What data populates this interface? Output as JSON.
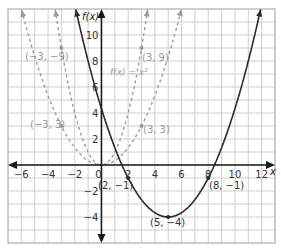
{
  "chart_data": {
    "type": "line",
    "title": "",
    "xlabel": "x",
    "ylabel": "f(x)",
    "xlim": [
      -7,
      13
    ],
    "ylim": [
      -6,
      12
    ],
    "grid": true,
    "x_ticks": [
      -6,
      -4,
      -2,
      0,
      2,
      4,
      6,
      8,
      10,
      12
    ],
    "x_tick_labels": [
      "−6",
      "−4",
      "−2",
      "0",
      "2",
      "4",
      "6",
      "8",
      "10",
      "12"
    ],
    "y_ticks": [
      -4,
      -2,
      2,
      4,
      6,
      8,
      10
    ],
    "y_tick_labels": [
      "−4",
      "−2",
      "2",
      "4",
      "6",
      "8",
      "10"
    ],
    "series": [
      {
        "name": "f(x) = x²",
        "equation": "x^2",
        "style": "dashed",
        "color": "#9a9a9a",
        "points": [
          [
            -3,
            9
          ],
          [
            3,
            9
          ]
        ]
      },
      {
        "name": "(1/3)x²",
        "equation": "x^2/3",
        "style": "dashed",
        "color": "#9a9a9a",
        "points": [
          [
            -3,
            3
          ],
          [
            3,
            3
          ]
        ]
      },
      {
        "name": "(1/3)(x−5)² − 4",
        "equation": "(x-5)^2/3 - 4",
        "style": "solid",
        "color": "#2a2a2a",
        "points": [
          [
            2,
            -1
          ],
          [
            5,
            -4
          ],
          [
            8,
            -1
          ]
        ]
      }
    ],
    "annotations": [
      {
        "text": "(−3, −9)",
        "x": -3,
        "y": 9,
        "color": "#9a9a9a"
      },
      {
        "text": "(3, 9)",
        "x": 3,
        "y": 9,
        "color": "#9a9a9a"
      },
      {
        "text": "f(x) = x²",
        "x": 1.5,
        "y": 7,
        "color": "#9a9a9a"
      },
      {
        "text": "(−3, 3)",
        "x": -3,
        "y": 3,
        "color": "#9a9a9a"
      },
      {
        "text": "(3, 3)",
        "x": 3,
        "y": 3,
        "color": "#9a9a9a"
      },
      {
        "text": "(2, −1)",
        "x": 2,
        "y": -1,
        "color": "#333333"
      },
      {
        "text": "(8, −1)",
        "x": 8,
        "y": -1,
        "color": "#333333"
      },
      {
        "text": "(5, −4)",
        "x": 5,
        "y": -4,
        "color": "#333333"
      }
    ]
  },
  "labels": {
    "x_axis": "x",
    "y_axis": "f(x)",
    "ann_m3_9": "(−3, −9)",
    "ann_3_9": "(3, 9)",
    "ann_fx": "f(x) = x²",
    "ann_m3_3": "(−3, 3)",
    "ann_3_3": "(3, 3)",
    "ann_2_m1": "(2, −1)",
    "ann_8_m1": "(8, −1)",
    "ann_5_m4": "(5, −4)"
  },
  "colors": {
    "grid": "#cfcfcf",
    "axis": "#1a1a1a",
    "dashed": "#9a9a9a",
    "solid": "#2a2a2a"
  }
}
